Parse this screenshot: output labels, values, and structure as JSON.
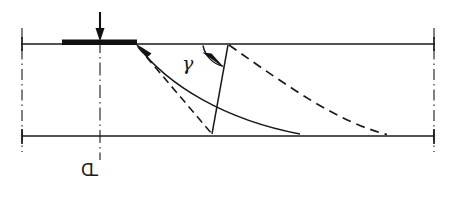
{
  "figure": {
    "domain": "diagram",
    "kind": "geotechnical-bearing-capacity-failure-mechanism",
    "background_color": "#ffffff",
    "ink_color": "#1a1a1a",
    "width": 458,
    "height": 198
  },
  "labels": {
    "gamma": "γ",
    "centerline_symbol": "СL"
  },
  "geometry": {
    "ground_line": {
      "name": "ground-surface-line",
      "x1": 22,
      "y1": 44,
      "x2": 434,
      "y2": 44,
      "stroke_width": 1.6
    },
    "base_line": {
      "name": "base-stratum-line",
      "x1": 22,
      "y1": 136,
      "x2": 434,
      "y2": 136,
      "stroke_width": 1.6
    },
    "footing": {
      "name": "strip-footing-plate",
      "x": 62,
      "y": 40,
      "width": 75,
      "height": 5,
      "fill": "#111111"
    },
    "load_arrow": {
      "name": "applied-load-arrow",
      "x": 100,
      "y_top": 12,
      "y_bottom": 40,
      "head_width": 9,
      "head_height": 13
    },
    "left_datum": {
      "name": "left-boundary-dashdot",
      "x": 22,
      "y_top": 28,
      "y_bottom": 152
    },
    "right_datum": {
      "name": "right-boundary-dashdot",
      "x": 434,
      "y_top": 28,
      "y_bottom": 152
    },
    "centerline": {
      "name": "footing-centerline-dashdot",
      "x": 100,
      "y_top": 40,
      "y_bottom": 160
    },
    "left_tick_top": {
      "x": 22,
      "y1": 38,
      "y2": 50
    },
    "left_tick_bottom": {
      "x": 22,
      "y1": 130,
      "y2": 144
    },
    "right_tick_top": {
      "x": 434,
      "y1": 38,
      "y2": 50
    },
    "right_tick_bottom": {
      "x": 434,
      "y1": 130,
      "y2": 144
    },
    "slip_surface_solid": {
      "name": "log-spiral-slip-surface-solid",
      "description": "curved failure surface from footing edge to base stratum",
      "start": [
        137,
        44
      ],
      "control1": [
        168,
        86
      ],
      "control2": [
        226,
        120
      ],
      "end": [
        300,
        134
      ],
      "stroke_width": 1.5
    },
    "slip_surface_dashed_inner": {
      "name": "inner-slip-surface-dashed",
      "description": "straight dashed rupture line from footing edge to base",
      "start": [
        137,
        46
      ],
      "end": [
        212,
        134
      ],
      "dash": "7,5"
    },
    "slip_surface_dashed_outer": {
      "name": "outer-slip-surface-dashed",
      "description": "dashed curved surface from ground point to base stratum",
      "start": [
        228,
        44
      ],
      "control1": [
        290,
        88
      ],
      "control2": [
        338,
        122
      ],
      "end": [
        386,
        134
      ],
      "dash": "8,6"
    },
    "radial_line": {
      "name": "radial-rupture-line-solid",
      "description": "straight radial line defining angle gamma with the ground surface",
      "start": [
        228,
        45
      ],
      "end": [
        212,
        134
      ],
      "stroke_width": 1.5
    },
    "angle_arc": {
      "name": "gamma-angle-arc",
      "description": "arc measuring angle gamma between ground surface and radial line",
      "center": [
        228,
        45
      ],
      "radius": 26,
      "start": [
        202,
        47
      ],
      "end": [
        222,
        66
      ]
    },
    "angle_arrowhead": {
      "name": "gamma-arc-arrowhead",
      "tip": [
        224,
        68
      ],
      "points": "203,53 224,68 211,54"
    },
    "footing_edge_arrow": {
      "name": "footing-edge-convergence-arrow",
      "tip": [
        139,
        45
      ],
      "points": "139,45 150,52 146,56"
    }
  }
}
